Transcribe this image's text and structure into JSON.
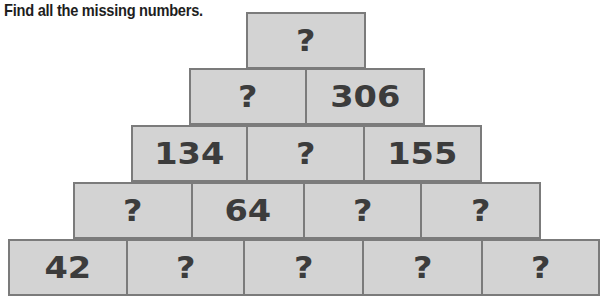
{
  "title": "Find all the missing numbers.",
  "colors": {
    "cell_fill": "#d3d3d3",
    "cell_border": "#7b7b7b",
    "text": "#3c3c3c"
  },
  "pyramid": {
    "rows": [
      {
        "cells": [
          "?"
        ]
      },
      {
        "cells": [
          "?",
          "306"
        ]
      },
      {
        "cells": [
          "134",
          "?",
          "155"
        ]
      },
      {
        "cells": [
          "?",
          "64",
          "?",
          "?"
        ]
      },
      {
        "cells": [
          "42",
          "?",
          "?",
          "?",
          "?"
        ]
      }
    ]
  }
}
